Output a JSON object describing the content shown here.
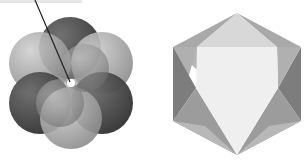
{
  "figure": {
    "panels": [
      {
        "name": "sphere-cluster",
        "description": "Cluster of six overlapping shaded spheres around a central bright point, with a pointer line",
        "center": [
          71,
          83
        ],
        "sphere_colors": [
          "#4a4a4a",
          "#9a9a9a",
          "#8c8c8c",
          "#3e3e3e",
          "#7a7a7a",
          "#a8a8a8"
        ],
        "pointer_color": "#222222",
        "center_dot_color": "#ffffff"
      },
      {
        "name": "faceted-hexagon",
        "description": "Hexagonal outline of an octahedron with shaded triangular faces",
        "center": [
          237,
          84
        ],
        "face_colors": {
          "center": "#efefef",
          "top": "#d8d8d8",
          "upper_left": "#a9a9a9",
          "upper_right": "#a9a9a9",
          "left": "#7d7d7d",
          "right": "#7d7d7d",
          "lower_left": "#9c9c9c",
          "lower_right": "#9c9c9c",
          "bottom_left_edge": "#b8b8b8",
          "bottom_right_edge": "#b8b8b8"
        }
      }
    ]
  }
}
